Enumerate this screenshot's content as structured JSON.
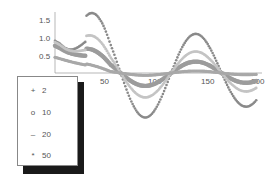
{
  "chart_data": {
    "type": "scatter",
    "title": "",
    "xlabel": "",
    "ylabel": "",
    "xlim": [
      0,
      200
    ],
    "ylim": [
      -1.6,
      1.6
    ],
    "x_ticks": [
      50,
      100,
      150,
      200
    ],
    "y_ticks": [
      0.5,
      1.0,
      1.5
    ],
    "grid": false,
    "legend_position": "lower-left overlay",
    "series": [
      {
        "name": "2",
        "marker": "+",
        "color": "#8a8a8a",
        "amplitude": 1.55,
        "offset": 0.92,
        "size": 1.3
      },
      {
        "name": "10",
        "marker": "o",
        "color": "#9c9c9c",
        "amplitude": 0.45,
        "offset": 0.78,
        "size": 2.2
      },
      {
        "name": "20",
        "marker": "-",
        "color": "#c4c4c4",
        "amplitude": 0.85,
        "offset": 0.88,
        "size": 1.4
      },
      {
        "name": "50",
        "marker": "*",
        "color": "#a8a8a8",
        "amplitude": 0.08,
        "offset": 0.45,
        "size": 1.6
      }
    ]
  },
  "axes": {
    "x_tick_labels": [
      "50",
      "100",
      "150",
      "200"
    ],
    "y_tick_labels": [
      "0.5",
      "1.0",
      "1.5"
    ]
  },
  "legend": {
    "items": [
      {
        "symbol": "+",
        "label": "2"
      },
      {
        "symbol": "o",
        "label": "10"
      },
      {
        "symbol": "–",
        "label": "20"
      },
      {
        "symbol": "*",
        "label": "50"
      }
    ]
  }
}
